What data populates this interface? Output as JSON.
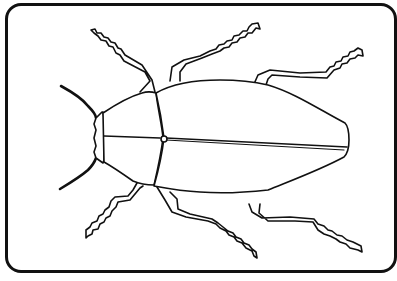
{
  "illustration": {
    "subject": "beetle",
    "style": "line-art coloring page",
    "stroke_color": "#111111",
    "background_color": "#ffffff",
    "parts": [
      "antenna-left",
      "antenna-right",
      "head",
      "thorax",
      "elytra",
      "leg-front-top",
      "leg-mid-top",
      "leg-rear-top",
      "leg-front-bottom",
      "leg-mid-bottom",
      "leg-rear-bottom"
    ]
  }
}
